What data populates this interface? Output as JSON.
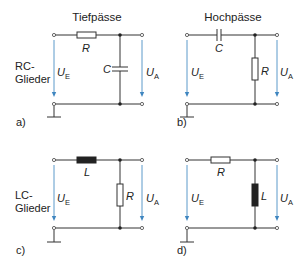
{
  "headings": {
    "lowpass": "Tiefpässe",
    "highpass": "Hochpässe"
  },
  "row_labels": {
    "rc_line1": "RC-",
    "rc_line2": "Glieder",
    "lc_line1": "LC-",
    "lc_line2": "Glieder"
  },
  "voltages": {
    "input_main": "U",
    "input_sub": "E",
    "output_main": "U",
    "output_sub": "A"
  },
  "circuits": [
    {
      "id": "a",
      "label": "a)",
      "type": "RC lowpass",
      "series": "R",
      "shunt": "C"
    },
    {
      "id": "b",
      "label": "b)",
      "type": "RC highpass",
      "series": "C",
      "shunt": "R"
    },
    {
      "id": "c",
      "label": "c)",
      "type": "LC lowpass",
      "series": "L",
      "shunt": "R"
    },
    {
      "id": "d",
      "label": "d)",
      "type": "LC highpass",
      "series": "R",
      "shunt": "L"
    }
  ],
  "colors": {
    "wire": "#333333",
    "arrow": "#4a8fc4",
    "text": "#222222"
  }
}
